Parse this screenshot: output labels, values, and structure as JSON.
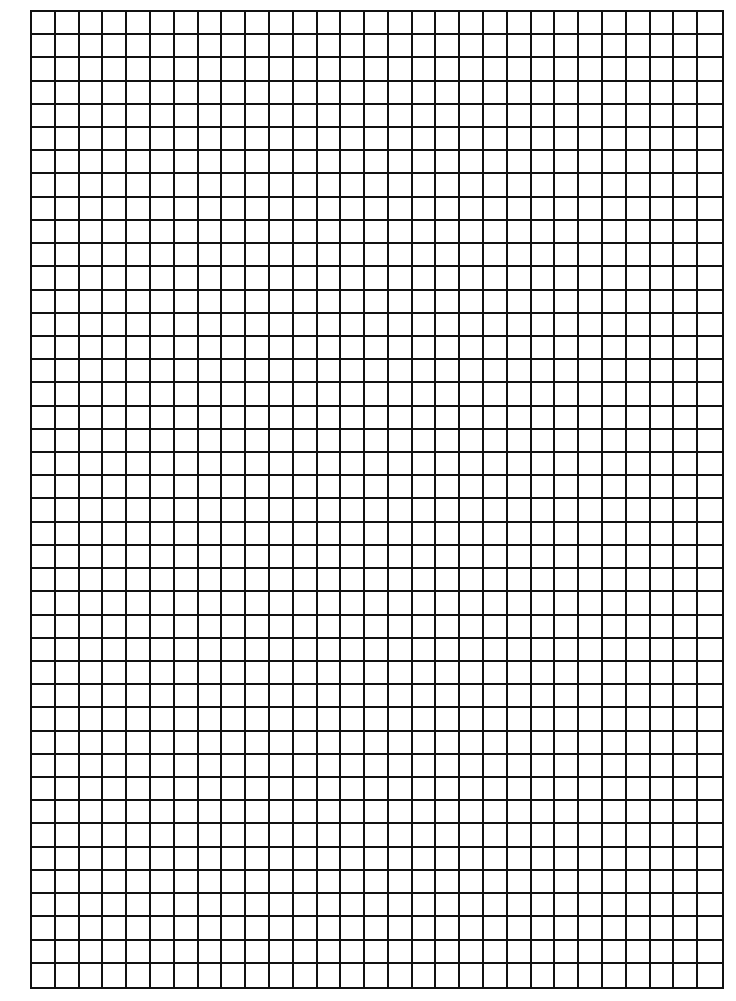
{
  "document": {
    "type": "graph-paper",
    "grid": {
      "columns": 29,
      "rows": 42,
      "line_color": "#111111",
      "background_color": "#ffffff",
      "line_width_px": 2
    }
  }
}
